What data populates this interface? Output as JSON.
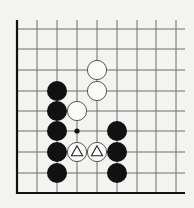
{
  "diagram": {
    "type": "go-board-fragment",
    "visible_columns": 9,
    "visible_rows": 9,
    "edges": [
      "left",
      "bottom"
    ],
    "colors": {
      "background": "#f3f3f1",
      "grid": "#6e6e6e",
      "edge": "#111111",
      "black_stone": "#111111",
      "white_stone_fill": "#fbfbfa",
      "white_stone_outline": "#555555"
    },
    "grid": {
      "x": [
        17,
        37,
        57,
        77,
        97,
        117,
        137,
        156,
        176
      ],
      "y": [
        29,
        49,
        70,
        91,
        111,
        131,
        152,
        173,
        193
      ],
      "top_extent": 20,
      "right_extent": 185
    },
    "stones": [
      {
        "color": "black",
        "col": 2,
        "row": 3
      },
      {
        "color": "black",
        "col": 2,
        "row": 4
      },
      {
        "color": "black",
        "col": 2,
        "row": 5
      },
      {
        "color": "black",
        "col": 2,
        "row": 6
      },
      {
        "color": "black",
        "col": 2,
        "row": 7
      },
      {
        "color": "white",
        "col": 4,
        "row": 2
      },
      {
        "color": "white",
        "col": 4,
        "row": 3
      },
      {
        "color": "white",
        "col": 3,
        "row": 4
      },
      {
        "color": "white",
        "col": 3,
        "row": 6,
        "marker": "triangle"
      },
      {
        "color": "white",
        "col": 4,
        "row": 6,
        "marker": "triangle"
      },
      {
        "color": "black",
        "col": 5,
        "row": 5
      },
      {
        "color": "black",
        "col": 5,
        "row": 6
      },
      {
        "color": "black",
        "col": 5,
        "row": 7
      }
    ],
    "point_markers": [
      {
        "type": "small-black-dot",
        "col": 3,
        "row": 5
      }
    ]
  }
}
